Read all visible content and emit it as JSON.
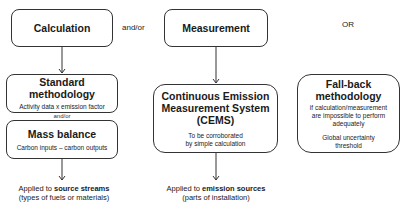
{
  "calculation": {
    "title": "Calculation"
  },
  "connector_andor_top": "and/or",
  "measurement": {
    "title": "Measurement"
  },
  "or_label": "OR",
  "standard_methodology": {
    "title_line1": "Standard",
    "title_line2": "methodology",
    "subtitle": "Activity data x emission factor"
  },
  "connector_andor_mid": "and/or",
  "mass_balance": {
    "title": "Mass balance",
    "subtitle": "Carbon inputs – carbon outputs"
  },
  "cems": {
    "title_line1": "Continuous Emission",
    "title_line2": "Measurement System",
    "title_line3": "(CEMS)",
    "subtitle_line1": "To be corroborated",
    "subtitle_line2": "by simple calculation"
  },
  "fallback": {
    "title_line1": "Fall-back",
    "title_line2": "methodology",
    "desc_line1": "if calculation/measurement",
    "desc_line2": "are impossible to perform",
    "desc_line3": "adequately",
    "desc2_line1": "Global uncertainty",
    "desc2_line2": "threshold"
  },
  "applied_calc": {
    "prefix": "Applied to ",
    "bold": "source streams",
    "line2": "(types of fuels or materials)"
  },
  "applied_meas": {
    "prefix": "Applied to ",
    "bold": "emission sources",
    "line2": "(parts of installation)"
  }
}
